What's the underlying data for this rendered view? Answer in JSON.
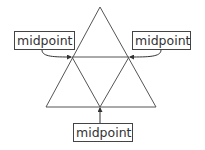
{
  "diagram": {
    "labels": [
      {
        "id": "left",
        "text": "midpoint"
      },
      {
        "id": "right",
        "text": "midpoint"
      },
      {
        "id": "bottom",
        "text": "midpoint"
      }
    ],
    "colors": {
      "stroke": "#444444",
      "background": "#ffffff"
    }
  }
}
